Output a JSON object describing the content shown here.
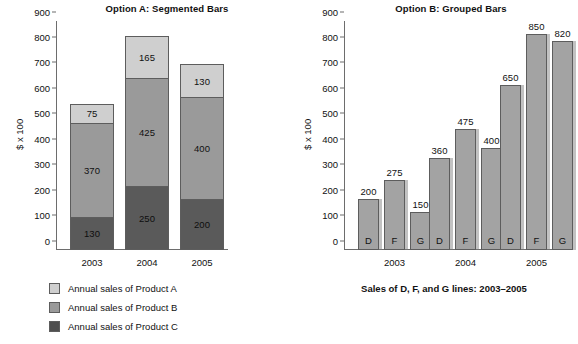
{
  "chart_data": [
    {
      "type": "bar",
      "id": "option-a",
      "title": "Option A: Segmented Bars",
      "subtype": "stacked",
      "xlabel": "",
      "ylabel": "$ x 100",
      "ylim": [
        0,
        900
      ],
      "yticks": [
        0,
        100,
        200,
        300,
        400,
        500,
        600,
        700,
        800,
        900
      ],
      "grid": false,
      "categories": [
        "2003",
        "2004",
        "2005"
      ],
      "series": [
        {
          "name": "Annual sales of Product C",
          "values": [
            130,
            250,
            200
          ],
          "color": "#5a5a5a",
          "order": "bottom"
        },
        {
          "name": "Annual sales of Product B",
          "values": [
            370,
            425,
            400
          ],
          "color": "#9a9a9a",
          "order": "middle"
        },
        {
          "name": "Annual sales of Product A",
          "values": [
            75,
            165,
            130
          ],
          "color": "#cfcfcf",
          "order": "top"
        }
      ],
      "totals": [
        575,
        840,
        730
      ],
      "legend_position": "below-left",
      "legend": [
        {
          "label": "Annual sales of Product A",
          "color": "#cfcfcf"
        },
        {
          "label": "Annual sales of Product B",
          "color": "#9a9a9a"
        },
        {
          "label": "Annual sales of Product C",
          "color": "#4f4f4f"
        }
      ]
    },
    {
      "type": "bar",
      "id": "option-b",
      "title": "Option B: Grouped Bars",
      "subtype": "grouped",
      "caption": "Sales of D, F, and G lines: 2003–2005",
      "xlabel": "",
      "ylabel": "$ x 100",
      "ylim": [
        0,
        900
      ],
      "yticks": [
        0,
        100,
        200,
        300,
        400,
        500,
        600,
        700,
        800,
        900
      ],
      "grid": false,
      "categories": [
        "2003",
        "2004",
        "2005"
      ],
      "bar_color": "#a3a3a3",
      "series": [
        {
          "name": "D",
          "values": [
            200,
            360,
            650
          ]
        },
        {
          "name": "F",
          "values": [
            275,
            475,
            850
          ]
        },
        {
          "name": "G",
          "values": [
            150,
            400,
            820
          ]
        }
      ],
      "bars": [
        {
          "group": "2003",
          "letter": "D",
          "value": 200
        },
        {
          "group": "2003",
          "letter": "F",
          "value": 275
        },
        {
          "group": "2003",
          "letter": "G",
          "value": 150
        },
        {
          "group": "2004",
          "letter": "D",
          "value": 360
        },
        {
          "group": "2004",
          "letter": "F",
          "value": 475
        },
        {
          "group": "2004",
          "letter": "G",
          "value": 400
        },
        {
          "group": "2005",
          "letter": "D",
          "value": 650
        },
        {
          "group": "2005",
          "letter": "F",
          "value": 850
        },
        {
          "group": "2005",
          "letter": "G",
          "value": 820
        }
      ]
    }
  ]
}
